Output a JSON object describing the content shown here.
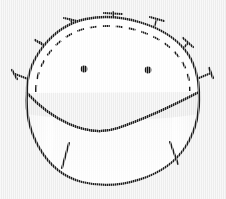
{
  "figure": {
    "description": "Hand-drawn ink sketch of a rounded dome cap pinned with straight pins along its curved upper edge, a dashed basting line running parallel inside the edge, two small dark dots like eyes, and a wide shaded lower body with two short tuck marks near the bottom.",
    "medium": "ink line drawing on light gray scanned paper",
    "background_color": "#f1f1f1",
    "ink_color": "#1b1b1b",
    "fill_color": "#ffffff",
    "shade_color": "#d8d8d8"
  },
  "canvas": {
    "width": 226,
    "height": 199
  },
  "shapes": {
    "dome": {
      "name": "dome-outline",
      "path": "M 27 93 C 26 60, 52 26, 86 19 C 120 12, 165 25, 185 50 C 195 62, 199 80, 199 92",
      "left_corner": [
        27,
        93
      ],
      "right_corner": [
        199,
        92
      ],
      "apex": [
        113,
        17
      ]
    },
    "dome_fill": {
      "name": "dome-fill",
      "path": "M 27 93 C 26 60, 52 26, 86 19 C 120 12, 165 25, 185 50 C 195 62, 199 80, 199 92 Z"
    },
    "basting_line": {
      "name": "dashed-basting-arc",
      "path": "M 36 92 C 35 63, 58 34, 88 28 C 120 21, 160 33, 178 56 C 187 67, 190 80, 190 91",
      "dash_pattern": "7 6",
      "stroke_width": 1.9
    },
    "lower_body": {
      "name": "lower-body-outline",
      "path": "M 27 93 C 24 130, 44 172, 82 182 C 118 191, 166 178, 186 146 C 196 130, 200 110, 199 92 C 176 104, 150 117, 118 128 C 86 139, 50 118, 27 93 Z"
    },
    "mouth_curve": {
      "name": "mouth-curve",
      "path": "M 27 93 C 50 118, 86 139, 118 128 C 150 117, 176 104, 199 92"
    }
  },
  "eyes": [
    {
      "name": "eye-left",
      "cx": 84,
      "cy": 69,
      "r": 3.4
    },
    {
      "name": "eye-right",
      "cx": 148,
      "cy": 70,
      "r": 3.4
    }
  ],
  "tuck_marks": [
    {
      "name": "tuck-mark-left",
      "x1": 69,
      "y1": 143,
      "x2": 62,
      "y2": 168
    },
    {
      "name": "tuck-mark-right",
      "x1": 170,
      "y1": 142,
      "x2": 178,
      "y2": 164
    }
  ],
  "pins": [
    {
      "name": "pin-left-lower",
      "shaft": [
        15,
        74,
        41,
        84
      ],
      "head": [
        12,
        70,
        17,
        79
      ]
    },
    {
      "name": "pin-left-upper",
      "shaft": [
        40,
        42,
        62,
        62
      ],
      "head": [
        35,
        40,
        45,
        46
      ]
    },
    {
      "name": "pin-top-left",
      "shaft": [
        70,
        19,
        80,
        40
      ],
      "head": [
        64,
        18,
        77,
        21
      ]
    },
    {
      "name": "pin-top-center",
      "shaft": [
        113,
        12,
        113,
        36
      ],
      "head": [
        104,
        13,
        122,
        14
      ]
    },
    {
      "name": "pin-top-right",
      "shaft": [
        157,
        19,
        149,
        41
      ],
      "head": [
        150,
        17,
        164,
        21
      ]
    },
    {
      "name": "pin-right-upper",
      "shaft": [
        188,
        43,
        170,
        63
      ],
      "head": [
        183,
        38,
        193,
        47
      ]
    },
    {
      "name": "pin-right-lower",
      "shaft": [
        211,
        73,
        187,
        83
      ],
      "head": [
        209,
        68,
        213,
        78
      ]
    }
  ],
  "counts": {
    "pins": 7,
    "eyes": 2,
    "tuck_marks": 2
  }
}
